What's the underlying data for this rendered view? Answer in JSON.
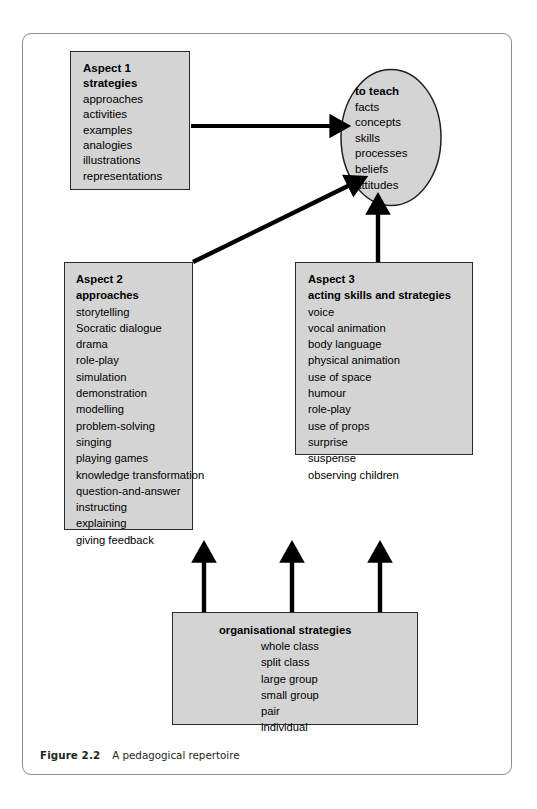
{
  "figure": {
    "caption_label": "Figure 2.2",
    "caption_text": "A pedagogical repertoire"
  },
  "colors": {
    "box_fill": "#d4d4d4",
    "box_border": "#2b2b2b",
    "arrow": "#000000",
    "frame_border": "#8b8b8b",
    "text": "#000000"
  },
  "nodes": {
    "aspect1": {
      "title_line1": "Aspect 1",
      "title_line2": "strategies",
      "items": [
        "approaches",
        "activities",
        "examples",
        "analogies",
        "illustrations",
        "representations"
      ]
    },
    "aspect2": {
      "title_line1": "Aspect 2",
      "title_line2": "approaches",
      "items": [
        "storytelling",
        "Socratic dialogue",
        "drama",
        "role-play",
        "simulation",
        "demonstration",
        "modelling",
        "problem-solving",
        "singing",
        "playing games",
        "knowledge transformation",
        "question-and-answer",
        "instructing",
        "explaining",
        "giving feedback"
      ]
    },
    "aspect3": {
      "title_line1": "Aspect 3",
      "title_line2": "acting skills and strategies",
      "items": [
        "voice",
        "vocal animation",
        "body language",
        "physical animation",
        "use of space",
        "humour",
        "role-play",
        "use of props",
        "surprise",
        "suspense",
        "observing children"
      ]
    },
    "to_teach": {
      "title": "to teach",
      "items": [
        "facts",
        "concepts",
        "skills",
        "processes",
        "beliefs",
        "attitudes"
      ]
    },
    "organisational": {
      "title": "organisational strategies",
      "items": [
        "whole class",
        "split class",
        "large group",
        "small group",
        "pair",
        "individual"
      ]
    }
  },
  "connections": [
    {
      "name": "aspect1-to-teach",
      "kind": "horizontal-arrow"
    },
    {
      "name": "aspect2-to-teach",
      "kind": "diagonal-arrow"
    },
    {
      "name": "aspect3-to-teach",
      "kind": "vertical-arrow"
    },
    {
      "name": "organisational-to-aspect2",
      "kind": "vertical-arrow"
    },
    {
      "name": "organisational-to-middle",
      "kind": "vertical-arrow"
    },
    {
      "name": "organisational-to-aspect3",
      "kind": "vertical-arrow"
    }
  ]
}
